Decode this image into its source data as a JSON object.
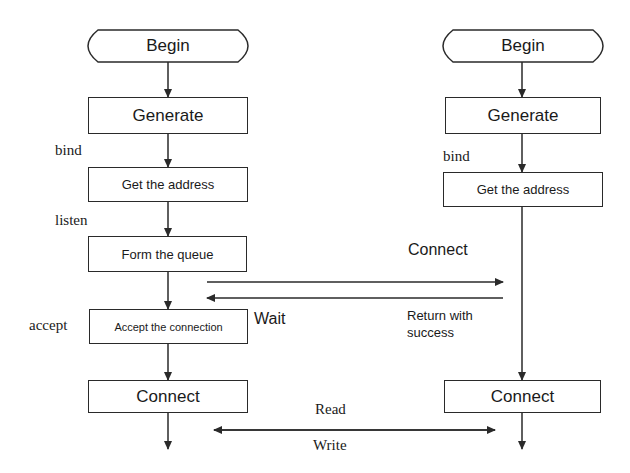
{
  "diagram": {
    "type": "flowchart",
    "server": {
      "begin": "Begin",
      "generate": "Generate",
      "bind_label": "bind",
      "get_address": "Get the address",
      "listen_label": "listen",
      "form_queue": "Form the queue",
      "accept_label": "accept",
      "accept_connection": "Accept the connection",
      "connect": "Connect"
    },
    "client": {
      "begin": "Begin",
      "generate": "Generate",
      "bind_label": "bind",
      "get_address": "Get the address",
      "connect": "Connect"
    },
    "messages": {
      "connect": "Connect",
      "wait": "Wait",
      "return_line1": "Return with",
      "return_line2": "success",
      "read": "Read",
      "write": "Write"
    },
    "colors": {
      "line": "#2a2a2a",
      "background": "#ffffff"
    }
  }
}
